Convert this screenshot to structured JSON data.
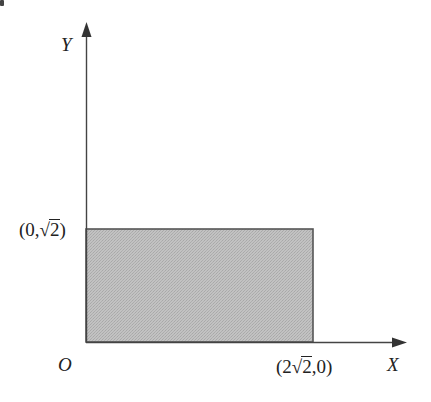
{
  "diagram": {
    "type": "coordinate-plane-region",
    "axes": {
      "x_label": "X",
      "y_label": "Y",
      "origin_label": "O"
    },
    "region": {
      "shape": "rectangle",
      "fill_color": "#bdbdbd",
      "stroke_color": "#555555"
    },
    "points": [
      {
        "name": "top-left-corner",
        "open": "(",
        "x": "0",
        "sep": ",",
        "y_radical": "√",
        "y_radicand": "2",
        "close": ")"
      },
      {
        "name": "bottom-right-corner",
        "open": "(",
        "x_coef": "2",
        "x_radical": "√",
        "x_radicand": "2",
        "sep": ",",
        "y": "0",
        "close": ")"
      }
    ],
    "colors": {
      "axis": "#444444",
      "text": "#222222",
      "fill": "#bdbdbd"
    }
  }
}
